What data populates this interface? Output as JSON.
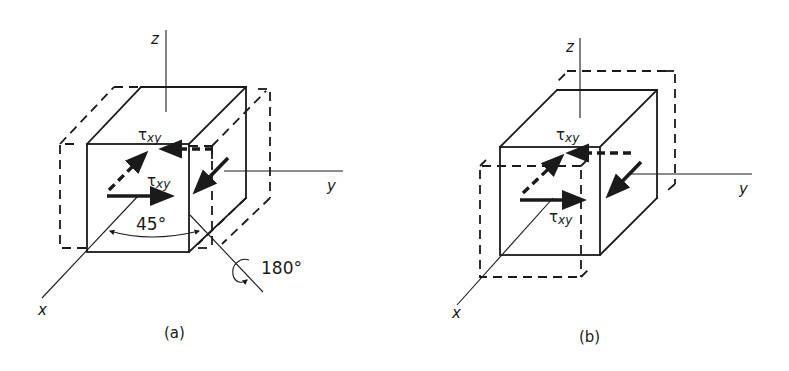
{
  "figure": {
    "panels": [
      {
        "id": "a",
        "caption": "(a)",
        "axes": {
          "x": "x",
          "y": "y",
          "z": "z"
        },
        "stress_labels": [
          "τxy",
          "τxy"
        ],
        "stress_symbol": "τ",
        "stress_subscript": "xy",
        "angle_label": "45°",
        "rotation_label": "180°"
      },
      {
        "id": "b",
        "caption": "(b)",
        "axes": {
          "x": "x",
          "y": "y",
          "z": "z"
        },
        "stress_labels": [
          "τxy",
          "τxy"
        ],
        "stress_symbol": "τ",
        "stress_subscript": "xy"
      }
    ],
    "colors": {
      "ink": "#1a1a1a",
      "background": "#ffffff"
    }
  }
}
